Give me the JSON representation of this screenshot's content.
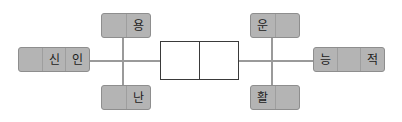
{
  "diagram": {
    "title": "",
    "background_color": "#ffffff",
    "line_color": "#9a9a9a",
    "gray_box_fill": "#b4b4b4",
    "gray_box_border": "#8e8e8e",
    "white_box_fill": "#ffffff",
    "white_box_border": "#3a3a3a",
    "nodes": {
      "left": {
        "name": "left-node",
        "cells": [
          "",
          "신",
          "인"
        ]
      },
      "top_left": {
        "name": "top-left-node",
        "cells": [
          "",
          "용"
        ]
      },
      "bottom_left": {
        "name": "bottom-left-node",
        "cells": [
          "",
          "난"
        ]
      },
      "center": {
        "name": "center-node",
        "cells": [
          "",
          ""
        ]
      },
      "top_right": {
        "name": "top-right-node",
        "cells": [
          "운",
          ""
        ]
      },
      "bottom_right": {
        "name": "bottom-right-node",
        "cells": [
          "활",
          ""
        ]
      },
      "right": {
        "name": "right-node",
        "cells": [
          "능",
          "",
          "적"
        ]
      }
    }
  }
}
